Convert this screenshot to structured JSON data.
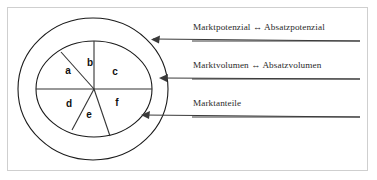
{
  "figure": {
    "background_color": "#ffffff",
    "frame_color": "#cfcfcf",
    "line_color": "#1a1a1a",
    "text_color": "#2a2a2a"
  },
  "callouts": [
    {
      "id": "marktpotenzial",
      "text": "Marktpotenzial ↔ Absatzpotenzial",
      "target": "outer-ellipse"
    },
    {
      "id": "marktvolumen",
      "text": "Marktvolumen ↔ Absatzvolumen",
      "target": "inner-ellipse"
    },
    {
      "id": "marktanteile",
      "text": "Marktanteile",
      "target": "pie-segments"
    }
  ],
  "pie": {
    "center_x": 94,
    "center_y": 89,
    "radius_x": 58,
    "radius_y": 48,
    "segments": [
      {
        "label": "a",
        "x": 68,
        "y": 71
      },
      {
        "label": "b",
        "x": 90,
        "y": 63
      },
      {
        "label": "c",
        "x": 115,
        "y": 72
      },
      {
        "label": "d",
        "x": 69,
        "y": 104
      },
      {
        "label": "e",
        "x": 89,
        "y": 115
      },
      {
        "label": "f",
        "x": 117,
        "y": 103
      }
    ]
  },
  "ellipses": {
    "outer": {
      "cx": 93,
      "cy": 89,
      "rx": 75,
      "ry": 71
    },
    "inner": {
      "cx": 94,
      "cy": 89,
      "rx": 58,
      "ry": 48
    }
  }
}
